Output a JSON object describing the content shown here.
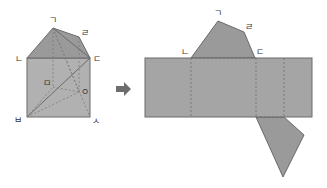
{
  "colors": {
    "face_dark": "#9a9a9a",
    "face_light": "#b1b1b1",
    "edge": "#6a6a6a",
    "hidden_edge": "#7c7c7c",
    "arrow": "#6d6d6d",
    "label": "#333333"
  },
  "solid_figure": {
    "labels": {
      "g": "ㄱ",
      "n": "ㄴ",
      "d": "ㄷ",
      "r": "ㄹ",
      "m": "ㅁ",
      "b": "ㅂ",
      "s": "ㅅ",
      "o": "ㅇ"
    }
  },
  "arrow": {
    "icon": "right-arrow-icon"
  },
  "net": {
    "labels": {
      "g": "ㄱ",
      "r": "ㄹ",
      "n": "ㄴ",
      "d": "ㄷ"
    }
  }
}
